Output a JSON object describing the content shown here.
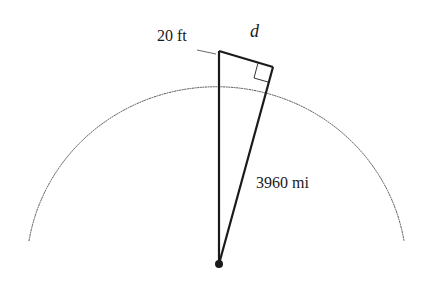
{
  "diagram": {
    "labels": {
      "height": "20 ft",
      "distance": "d",
      "radius": "3960 mi"
    },
    "elements": [
      "earth-arc",
      "vertical-radius-plus-height",
      "tangent-line-d",
      "radius-to-tangent-point",
      "right-angle-marker",
      "center-point"
    ],
    "colors": {
      "stroke": "#1a1a1a",
      "arc": "#555555",
      "background": "#ffffff"
    }
  }
}
